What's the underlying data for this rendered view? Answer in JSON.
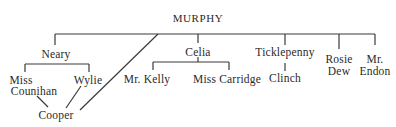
{
  "diagram": {
    "root": "MURPHY",
    "nodes": {
      "neary": "Neary",
      "celia": "Celia",
      "ticklepenny": "Ticklepenny",
      "rosie_dew_line1": "Rosie",
      "rosie_dew_line2": "Dew",
      "mr_endon_line1": "Mr.",
      "mr_endon_line2": "Endon",
      "miss_counihan_line1": "Miss",
      "miss_counihan_line2": "Counihan",
      "wylie": "Wylie",
      "cooper": "Cooper",
      "mr_kelly": "Mr. Kelly",
      "miss_carridge": "Miss Carridge",
      "clinch": "Clinch"
    },
    "edges": [
      [
        "MURPHY",
        "Neary"
      ],
      [
        "MURPHY",
        "Celia"
      ],
      [
        "MURPHY",
        "Ticklepenny"
      ],
      [
        "MURPHY",
        "Rosie Dew"
      ],
      [
        "MURPHY",
        "Mr. Endon"
      ],
      [
        "MURPHY",
        "Cooper"
      ],
      [
        "Neary",
        "Miss Counihan"
      ],
      [
        "Neary",
        "Wylie"
      ],
      [
        "Miss Counihan",
        "Cooper"
      ],
      [
        "Wylie",
        "Cooper"
      ],
      [
        "Celia",
        "Mr. Kelly"
      ],
      [
        "Celia",
        "Miss Carridge"
      ],
      [
        "Ticklepenny",
        "Clinch"
      ]
    ],
    "line_color": "#3a3a3a",
    "text_color": "#2a2a2a"
  }
}
